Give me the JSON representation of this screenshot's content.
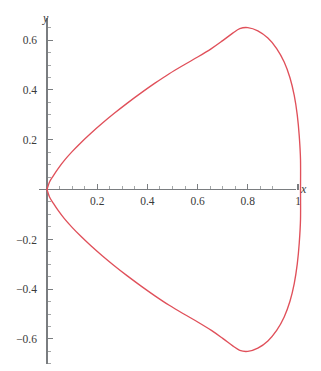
{
  "figure": {
    "background_color": "#ffffff",
    "width": 321,
    "height": 371,
    "axis_color": "#7a7d80",
    "tick_label_color": "#3a3a3a",
    "curve_color": "#e0505a"
  },
  "axes": {
    "x_axis_label": "x",
    "y_axis_label": "y",
    "x_tick_labels": [
      "0.2",
      "0.4",
      "0.6",
      "0.8",
      "1"
    ],
    "x_tick_values": [
      0.2,
      0.4,
      0.6,
      0.8,
      1.0
    ],
    "y_tick_labels": [
      "0.6",
      "0.4",
      "0.2",
      "-0.2",
      "-0.4",
      "-0.6"
    ],
    "y_tick_values": [
      0.6,
      0.4,
      0.2,
      -0.2,
      -0.4,
      -0.6
    ],
    "x_minor_step": 0.05,
    "y_minor_step": 0.05,
    "origin_px": [
      47,
      189.5
    ],
    "px_per_unit_x": 251,
    "px_per_unit_y": 249,
    "x_axis_extent_px": [
      39,
      296
    ],
    "y_axis_extent_px": [
      18,
      364
    ]
  },
  "chart_data": {
    "type": "line",
    "title": "",
    "subtitle": "",
    "xlabel": "x",
    "ylabel": "y",
    "xlim": [
      -0.03,
      1.03
    ],
    "ylim": [
      -0.7,
      0.7
    ],
    "grid": false,
    "legend": null,
    "annotations": [],
    "series": [
      {
        "name": "curve",
        "color": "#e0505a",
        "closed": true,
        "symmetric_about_x_axis": true,
        "key_points": {
          "cusp": [
            0.0,
            0.0
          ],
          "upper_max": [
            0.755,
            0.65
          ],
          "lower_min": [
            0.755,
            -0.65
          ],
          "rightmost": [
            1.01,
            0.0
          ]
        },
        "upper_branch": [
          [
            0.0,
            0.0
          ],
          [
            0.01,
            0.03
          ],
          [
            0.025,
            0.055
          ],
          [
            0.045,
            0.085
          ],
          [
            0.07,
            0.118
          ],
          [
            0.1,
            0.152
          ],
          [
            0.135,
            0.188
          ],
          [
            0.175,
            0.226
          ],
          [
            0.22,
            0.266
          ],
          [
            0.268,
            0.306
          ],
          [
            0.32,
            0.347
          ],
          [
            0.375,
            0.388
          ],
          [
            0.43,
            0.427
          ],
          [
            0.487,
            0.465
          ],
          [
            0.545,
            0.5
          ],
          [
            0.602,
            0.533
          ],
          [
            0.655,
            0.566
          ],
          [
            0.7,
            0.598
          ],
          [
            0.74,
            0.628
          ],
          [
            0.768,
            0.646
          ],
          [
            0.8,
            0.65
          ],
          [
            0.84,
            0.637
          ],
          [
            0.88,
            0.608
          ],
          [
            0.915,
            0.566
          ],
          [
            0.945,
            0.512
          ],
          [
            0.968,
            0.449
          ],
          [
            0.985,
            0.378
          ],
          [
            0.997,
            0.3
          ],
          [
            1.005,
            0.215
          ],
          [
            1.01,
            0.12
          ],
          [
            1.01,
            0.0
          ]
        ],
        "lower_branch": [
          [
            0.0,
            0.0
          ],
          [
            0.01,
            -0.03
          ],
          [
            0.025,
            -0.055
          ],
          [
            0.045,
            -0.085
          ],
          [
            0.07,
            -0.118
          ],
          [
            0.1,
            -0.152
          ],
          [
            0.135,
            -0.188
          ],
          [
            0.175,
            -0.226
          ],
          [
            0.22,
            -0.266
          ],
          [
            0.268,
            -0.306
          ],
          [
            0.32,
            -0.347
          ],
          [
            0.375,
            -0.388
          ],
          [
            0.43,
            -0.427
          ],
          [
            0.487,
            -0.465
          ],
          [
            0.545,
            -0.5
          ],
          [
            0.602,
            -0.533
          ],
          [
            0.655,
            -0.566
          ],
          [
            0.7,
            -0.598
          ],
          [
            0.74,
            -0.628
          ],
          [
            0.768,
            -0.646
          ],
          [
            0.8,
            -0.65
          ],
          [
            0.84,
            -0.637
          ],
          [
            0.88,
            -0.608
          ],
          [
            0.915,
            -0.566
          ],
          [
            0.945,
            -0.512
          ],
          [
            0.968,
            -0.449
          ],
          [
            0.985,
            -0.378
          ],
          [
            0.997,
            -0.3
          ],
          [
            1.005,
            -0.215
          ],
          [
            1.01,
            -0.12
          ],
          [
            1.01,
            0.0
          ]
        ]
      }
    ]
  }
}
